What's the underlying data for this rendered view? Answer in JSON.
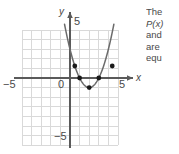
{
  "figure": {
    "name": "parabola-graph-figure",
    "colors": {
      "grid": "#d9d9d9",
      "axis": "#5a5a5a",
      "curve": "#6b6b6b",
      "point": "#1a1a1a",
      "text": "#4a4a4a",
      "background": "#ffffff"
    },
    "axes": {
      "x_label": "x",
      "y_label": "y",
      "x_ticks": [
        {
          "value": -5,
          "label": "−5"
        },
        {
          "value": 0,
          "label": "0"
        },
        {
          "value": 5,
          "label": "5"
        }
      ],
      "y_ticks": [
        {
          "value": 5,
          "label": "5"
        },
        {
          "value": -5,
          "label": "−5"
        }
      ],
      "xlim": [
        -5.6,
        5.6
      ],
      "ylim": [
        -5.6,
        5.6
      ],
      "grid": true
    }
  },
  "chart_data": {
    "type": "line",
    "title": "",
    "xlabel": "x",
    "ylabel": "y",
    "xlim": [
      -5.6,
      5.6
    ],
    "ylim": [
      -5.6,
      5.6
    ],
    "grid": true,
    "legend": "none",
    "series": [
      {
        "name": "P(x)",
        "kind": "parabola",
        "equation_form": "y = a(x - h)^2 + k",
        "vertex": [
          2,
          -1
        ],
        "a": 1,
        "x": [
          -0.2,
          0,
          0.5,
          1,
          1.5,
          2,
          2.5,
          3,
          3.5,
          4,
          4.2
        ],
        "y": [
          3.84,
          4,
          1.25,
          0,
          -0.75,
          -1,
          -0.75,
          0,
          0.25,
          3,
          3.84
        ]
      }
    ],
    "marked_points": [
      {
        "x": 0.5,
        "y": 1.25,
        "label": ""
      },
      {
        "x": 1,
        "y": 0,
        "label": ""
      },
      {
        "x": 2,
        "y": -1,
        "label": ""
      },
      {
        "x": 3,
        "y": 0,
        "label": ""
      },
      {
        "x": 4.4,
        "y": 1.25,
        "label": ""
      }
    ]
  },
  "caption": {
    "name": "problem-text",
    "lines": [
      {
        "text": "The",
        "italic": false
      },
      {
        "text": "P(x)",
        "italic": true
      },
      {
        "text": "and",
        "italic": false
      },
      {
        "text": "are",
        "italic": false
      },
      {
        "text": "equ",
        "italic": false
      }
    ]
  }
}
